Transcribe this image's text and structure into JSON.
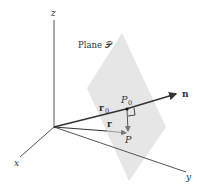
{
  "diagram": {
    "labels": {
      "z_axis": "z",
      "x_axis": "x",
      "y_axis": "y",
      "plane": "Plane 𝒫",
      "normal": "n",
      "r0": "r",
      "r0_sub": "0",
      "r": "r",
      "p0": "P",
      "p0_sub": "0",
      "p": "P"
    },
    "colors": {
      "plane_fill": "#e6e6e6",
      "axis": "#555555",
      "vector": "#333333",
      "text": "#333333"
    }
  }
}
